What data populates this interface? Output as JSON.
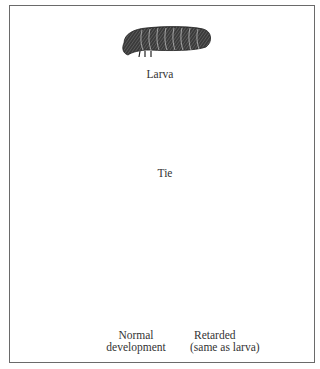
{
  "figure": {
    "stages": [
      {
        "id": "larva",
        "label": "Larva"
      },
      {
        "id": "tie",
        "label": "Tie"
      },
      {
        "id": "result",
        "label": ""
      }
    ],
    "annotations": [
      {
        "id": "normal",
        "line1": "Normal",
        "line2": "development"
      },
      {
        "id": "retarded",
        "line1": "Retarded",
        "line2": "(same as larva)"
      }
    ],
    "colors": {
      "ink": "#2a2a2a",
      "frame": "#6a6a6a",
      "background": "#ffffff"
    }
  }
}
